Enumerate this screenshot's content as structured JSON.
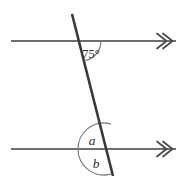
{
  "figure": {
    "background_color": "#ffffff",
    "width": 189,
    "height": 187
  },
  "style": {
    "parallel_line_color": "#6e6e6e",
    "transversal_color": "#3a3a3a",
    "arc_color": "#787878",
    "label_color": "#2c2c2c",
    "arrow_color": "#4a4a4a"
  },
  "lines": {
    "top_parallel": {
      "name": "upper parallel line",
      "x1": 11,
      "y1": 41,
      "x2": 176,
      "y2": 41,
      "arrow_marks": 2,
      "arrow_direction": "right"
    },
    "bottom_parallel": {
      "name": "lower parallel line",
      "x1": 11,
      "y1": 149,
      "x2": 176,
      "y2": 149,
      "arrow_marks": 2,
      "arrow_direction": "right"
    },
    "transversal": {
      "name": "transversal",
      "x1": 72,
      "y1": 14,
      "x2": 113,
      "y2": 176
    }
  },
  "intersections": {
    "top": {
      "x": 81,
      "y": 41
    },
    "bottom": {
      "x": 104,
      "y": 149
    }
  },
  "angles": [
    {
      "id": "angle-75",
      "label": "75°",
      "value": 75,
      "unit": "degrees",
      "known": true,
      "at_intersection": "top",
      "position": "below the upper line, right of the transversal",
      "label_x": 91,
      "label_y": 55,
      "arc_radius": 20
    },
    {
      "id": "angle-a",
      "label": "a",
      "value": null,
      "unit": "degrees",
      "known": false,
      "at_intersection": "bottom",
      "position": "above the lower line, left of the transversal",
      "label_x": 92,
      "label_y": 142,
      "arc_radius": 26
    },
    {
      "id": "angle-b",
      "label": "b",
      "value": null,
      "unit": "degrees",
      "known": false,
      "at_intersection": "bottom",
      "position": "below the lower line, left of the transversal",
      "label_x": 96,
      "label_y": 165,
      "arc_radius": 26
    }
  ]
}
